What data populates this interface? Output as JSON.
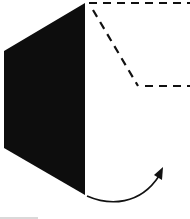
{
  "diagram": {
    "colors": {
      "panel_fill": "#0d0d0d",
      "dash_stroke": "#111111",
      "arrow_stroke": "#111111",
      "background": "#ffffff"
    },
    "solid_panel": {
      "points": "4,51 85,3 85,195 4,148"
    },
    "dashed_outline": {
      "top_line": {
        "x1": 89,
        "y1": 3,
        "x2": 190,
        "y2": 3
      },
      "diagonal_line": {
        "x1": 93,
        "y1": 10,
        "x2": 138,
        "y2": 86
      },
      "lower_line": {
        "x1": 145,
        "y1": 86,
        "x2": 190,
        "y2": 86
      }
    },
    "arrow": {
      "path": "M87,196 C110,206 140,205 159,176",
      "head": "154,175 163,167 162,180"
    }
  }
}
